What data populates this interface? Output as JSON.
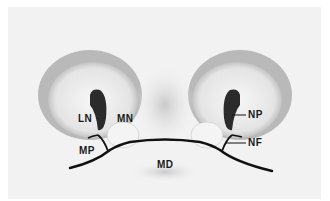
{
  "figure": {
    "type": "anatomical-illustration",
    "labels": [
      {
        "id": "LN",
        "text": "LN"
      },
      {
        "id": "MN",
        "text": "MN"
      },
      {
        "id": "MP",
        "text": "MP"
      },
      {
        "id": "MD",
        "text": "MD"
      },
      {
        "id": "NP",
        "text": "NP"
      },
      {
        "id": "NF",
        "text": "NF"
      }
    ]
  }
}
